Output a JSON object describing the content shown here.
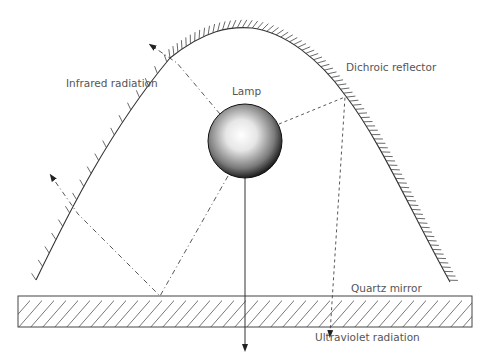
{
  "diagram": {
    "labels": {
      "infrared": "Infrared radiation",
      "lamp": "Lamp",
      "reflector": "Dichroic reflector",
      "mirror": "Quartz mirror",
      "ultraviolet": "Ultraviolet radiation"
    },
    "colors": {
      "line": "#333333",
      "text": "#555555",
      "hatch": "#444444",
      "lamp_highlight": "#ffffff",
      "lamp_edge": "#111111"
    },
    "components": [
      {
        "id": "reflector",
        "type": "curved hatched reflector"
      },
      {
        "id": "lamp",
        "type": "spherical lamp"
      },
      {
        "id": "mirror",
        "type": "hatched rectangular quartz mirror"
      }
    ],
    "rays": [
      {
        "id": "ir-ray-upper",
        "style": "dash-dot",
        "path": "lamp -> reflector -> outward (infrared)"
      },
      {
        "id": "ir-ray-lower",
        "style": "dash-dot",
        "path": "lamp -> quartz mirror -> reflector -> outward (infrared)"
      },
      {
        "id": "uv-ray",
        "style": "dashed",
        "path": "lamp -> reflector -> through mirror (ultraviolet)"
      },
      {
        "id": "direct-ray",
        "style": "solid",
        "path": "lamp -> straight down through mirror"
      }
    ]
  }
}
